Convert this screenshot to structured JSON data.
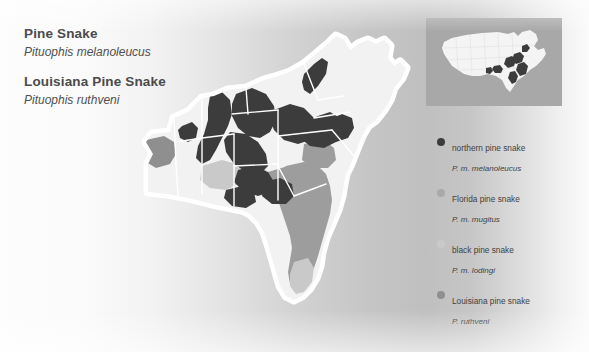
{
  "page": {
    "width": 589,
    "height": 352,
    "background_gradient_from": "#fdfdfd",
    "background_gradient_to": "#bfbfbf"
  },
  "titles": {
    "species1_common": "Pine Snake",
    "species1_scientific": "Pituophis melanoleucus",
    "species2_common": "Louisiana Pine Snake",
    "species2_scientific": "Pituophis ruthveni"
  },
  "legend": {
    "items": [
      {
        "name": "northern pine snake",
        "scientific": "P. m. melanoleucus",
        "color": "#3c3c3c"
      },
      {
        "name": "Florida pine snake",
        "scientific": "P. m. mugitus",
        "color": "#a9a9a9"
      },
      {
        "name": "black pine snake",
        "scientific": "P. m. lodingi",
        "color": "#c9c9c9"
      },
      {
        "name": "Louisiana pine snake",
        "scientific": "P. ruthveni",
        "color": "#8f8f8f"
      }
    ]
  },
  "map": {
    "land_color": "#f2f2f2",
    "halo_color": "#ffffff",
    "state_border_color": "#ffffff",
    "range_northern": "#3c3c3c",
    "range_florida": "#9d9d9d",
    "range_black": "#c9c9c9",
    "range_louisiana": "#8f8f8f",
    "region": "Southeastern United States"
  },
  "inset": {
    "background_color": "#a8a8a8",
    "land_color": "#f4f4f4",
    "range_color": "#3c3c3c",
    "region": "United States"
  }
}
